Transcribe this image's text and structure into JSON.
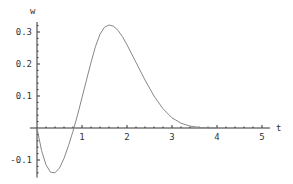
{
  "chart_data": {
    "type": "line",
    "title": "",
    "xlabel": "t",
    "ylabel": "w",
    "xlim": [
      0,
      5.2
    ],
    "ylim": [
      -0.15,
      0.33
    ],
    "grid": false,
    "x_ticks": [
      "1",
      "2",
      "3",
      "4",
      "5"
    ],
    "y_ticks": [
      "0.3",
      "0.2",
      "0.1",
      "-0.1"
    ],
    "series": [
      {
        "name": "w(t)",
        "x": [
          0,
          0.1,
          0.2,
          0.3,
          0.4,
          0.5,
          0.6,
          0.7,
          0.8,
          0.9,
          1.0,
          1.1,
          1.2,
          1.3,
          1.4,
          1.5,
          1.6,
          1.7,
          1.8,
          1.9,
          2.0,
          2.2,
          2.4,
          2.6,
          2.8,
          3.0,
          3.2,
          3.4,
          3.6,
          3.8,
          4.0
        ],
        "values": [
          0,
          -0.07,
          -0.115,
          -0.138,
          -0.14,
          -0.125,
          -0.095,
          -0.055,
          -0.01,
          0.04,
          0.095,
          0.15,
          0.205,
          0.255,
          0.293,
          0.315,
          0.322,
          0.318,
          0.305,
          0.285,
          0.26,
          0.205,
          0.15,
          0.1,
          0.06,
          0.032,
          0.015,
          0.006,
          0.002,
          0.0005,
          0
        ]
      }
    ]
  }
}
